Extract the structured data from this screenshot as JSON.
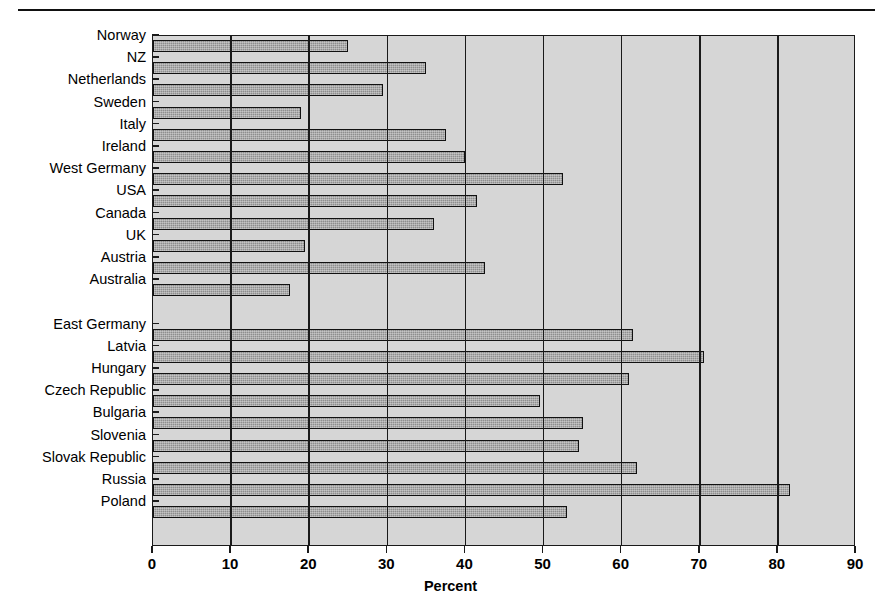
{
  "chart_data": {
    "type": "bar",
    "orientation": "horizontal",
    "title": "",
    "subtitle": "",
    "xlabel": "Percent",
    "ylabel": "",
    "xlim": [
      0,
      90
    ],
    "xticks": [
      0,
      10,
      20,
      30,
      40,
      50,
      60,
      70,
      80,
      90
    ],
    "xtick_labels": [
      "0",
      "10",
      "20",
      "30",
      "40",
      "50",
      "60",
      "70",
      "80",
      "90"
    ],
    "grid": true,
    "grid_axis": "x",
    "legend": false,
    "legend_position": "none",
    "group_gap_after": "Australia",
    "categories": [
      "Norway",
      "NZ",
      "Netherlands",
      "Sweden",
      "Italy",
      "Ireland",
      "West Germany",
      "USA",
      "Canada",
      "UK",
      "Austria",
      "Australia",
      "East Germany",
      "Latvia",
      "Hungary",
      "Czech Republic",
      "Bulgaria",
      "Slovenia",
      "Slovak Republic",
      "Russia",
      "Poland"
    ],
    "values": [
      25,
      35,
      29.5,
      19,
      37.5,
      40,
      52.5,
      41.5,
      36,
      19.5,
      42.5,
      17.5,
      61.5,
      70.5,
      61,
      49.5,
      55,
      54.5,
      62,
      81.5,
      53
    ],
    "groups": [
      {
        "name": "Western countries",
        "categories": [
          "Norway",
          "NZ",
          "Netherlands",
          "Sweden",
          "Italy",
          "Ireland",
          "West Germany",
          "USA",
          "Canada",
          "UK",
          "Austria",
          "Australia"
        ]
      },
      {
        "name": "Transition countries",
        "categories": [
          "East Germany",
          "Latvia",
          "Hungary",
          "Czech Republic",
          "Bulgaria",
          "Slovenia",
          "Slovak Republic",
          "Russia",
          "Poland"
        ]
      }
    ],
    "colors": {
      "bar_fill": "#8e8e8e",
      "bar_edge": "#111111",
      "plot_background": "#d6d6d6",
      "grid_color": "#1a1a1a",
      "axis_color": "#1a1a1a",
      "page_background": "#ffffff",
      "text": "#000000"
    }
  }
}
